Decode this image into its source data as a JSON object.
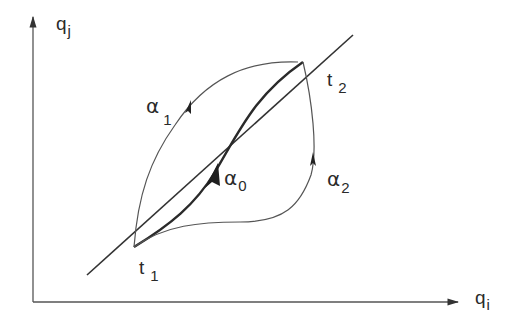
{
  "diagram": {
    "type": "path-variation",
    "axes": {
      "x": {
        "label_base": "q",
        "label_sub": "i"
      },
      "y": {
        "label_base": "q",
        "label_sub": "j"
      }
    },
    "points": [
      {
        "id": "t1",
        "base": "t",
        "sub": "1"
      },
      {
        "id": "t2",
        "base": "t",
        "sub": "2"
      }
    ],
    "paths": [
      {
        "id": "alpha0",
        "base": "α",
        "sub": "0",
        "style": "thick",
        "description": "actual path (bold)"
      },
      {
        "id": "alpha1",
        "base": "α",
        "sub": "1",
        "style": "thin",
        "description": "varied path above"
      },
      {
        "id": "alpha2",
        "base": "α",
        "sub": "2",
        "style": "thin",
        "description": "varied path below"
      }
    ],
    "colors": {
      "line": "#3a3a3a",
      "background": "#ffffff"
    }
  }
}
